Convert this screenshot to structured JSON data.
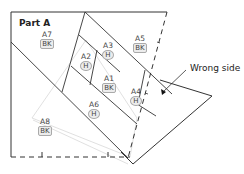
{
  "diagram": {
    "title": "Part A",
    "callout": "Wrong side",
    "pieces": [
      {
        "id": "A1",
        "label": "A1",
        "fabric": "BK"
      },
      {
        "id": "A2",
        "label": "A2",
        "fabric": "H"
      },
      {
        "id": "A3",
        "label": "A3",
        "fabric": "H"
      },
      {
        "id": "A4",
        "label": "A4",
        "fabric": "H"
      },
      {
        "id": "A5",
        "label": "A5",
        "fabric": "BK"
      },
      {
        "id": "A6",
        "label": "A6",
        "fabric": "H"
      },
      {
        "id": "A7",
        "label": "A7",
        "fabric": "BK"
      },
      {
        "id": "A8",
        "label": "A8",
        "fabric": "BK"
      }
    ],
    "colors": {
      "line": "#333333",
      "light_line": "#c8c8c8",
      "badge_fill": "#ececec"
    }
  }
}
